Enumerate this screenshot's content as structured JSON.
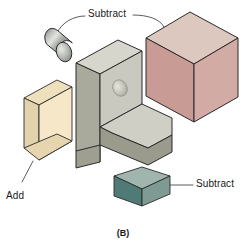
{
  "figure": {
    "caption": "(B)",
    "labels": {
      "subtract_top": "Subtract",
      "subtract_bottom": "Subtract",
      "add": "Add"
    },
    "colors": {
      "cylinder_body": "#8f9490",
      "cylinder_body_light": "#d5d8d4",
      "cylinder_cap": "#b9bdb8",
      "bracket_top": "#d6d6cc",
      "bracket_left": "#a9a99c",
      "bracket_front": "#c9c9c0",
      "bracket_base_front": "#9a9a8d",
      "cube_top": "#ddc8bf",
      "cube_left": "#c89b94",
      "cube_right": "#d2aba4",
      "box_top": "#efe0bd",
      "box_left": "#e3d3ad",
      "box_front": "#f5e7c8",
      "wedge_top": "#9fb5ad",
      "wedge_left": "#4f7a76",
      "wedge_right": "#7f9a93",
      "outline": "#2b2b2b",
      "leader": "#4a4a4a",
      "text": "#1a1a1a",
      "background": "#ffffff"
    },
    "shapes": [
      {
        "name": "cylinder",
        "operation": "Subtract",
        "color": "#8f9490"
      },
      {
        "name": "cube",
        "operation": "Subtract",
        "color": "#c89b94"
      },
      {
        "name": "wedge",
        "operation": "Subtract",
        "color": "#7f9a93"
      },
      {
        "name": "rectangular-box",
        "operation": "Add",
        "color": "#f5e7c8"
      },
      {
        "name": "l-bracket",
        "operation": "Base",
        "color": "#c9c9c0"
      }
    ]
  }
}
